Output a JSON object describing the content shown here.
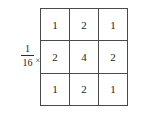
{
  "figure": {
    "type": "convolution-kernel-matrix",
    "scalar": {
      "numerator": "1",
      "denominator": "16",
      "operator": "×"
    },
    "matrix": {
      "rows": 3,
      "cols": 3,
      "values": [
        [
          "1",
          "2",
          "1"
        ],
        [
          "2",
          "4",
          "2"
        ],
        [
          "1",
          "2",
          "1"
        ]
      ]
    }
  },
  "chart_data": {
    "type": "heatmap",
    "title": "",
    "xlabel": "",
    "ylabel": "",
    "categories": [
      "col1",
      "col2",
      "col3"
    ],
    "rows": [
      "row1",
      "row2",
      "row3"
    ],
    "values": [
      [
        1,
        2,
        1
      ],
      [
        2,
        4,
        2
      ],
      [
        1,
        2,
        1
      ]
    ],
    "scale_factor": 0.0625,
    "scale_label": "1/16",
    "grid": true,
    "legend": "none"
  }
}
